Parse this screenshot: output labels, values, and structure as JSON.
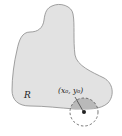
{
  "diagram": {
    "region_label": "R",
    "point_label": "(x₀, y₀)",
    "colors": {
      "region_fill": "#e2e2e2",
      "region_stroke": "#8a8a8a",
      "disk_inside_fill": "#b9b9b9",
      "circle_stroke": "#555555",
      "point": "#222222"
    }
  }
}
